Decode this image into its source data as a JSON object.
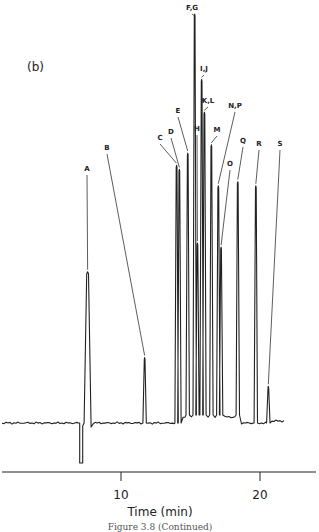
{
  "figure": {
    "panel_label": "(b)",
    "caption": "Figure 3.8 (Continued)"
  },
  "axis": {
    "xlabel": "Time (min)",
    "ticks": [
      {
        "value": 10,
        "label": "10"
      },
      {
        "value": 20,
        "label": "20"
      }
    ]
  },
  "chart_data": {
    "type": "line",
    "title": "(b)",
    "xlabel": "Time (min)",
    "ylabel": "",
    "xlim": [
      1.3,
      24.5
    ],
    "x_ticks": [
      10,
      20
    ],
    "grid": false,
    "legend": null,
    "baseline_dip": {
      "time": 7.1,
      "depth_rel": -0.17
    },
    "peaks": [
      {
        "label": "A",
        "time": 7.6,
        "height_rel": 0.37
      },
      {
        "label": "B",
        "time": 11.7,
        "height_rel": 0.16
      },
      {
        "label": "C",
        "time": 14.0,
        "height_rel": 0.63
      },
      {
        "label": "D",
        "time": 14.2,
        "height_rel": 0.62
      },
      {
        "label": "E",
        "time": 14.8,
        "height_rel": 0.66
      },
      {
        "label": "F,G",
        "time": 15.3,
        "height_rel": 1.0
      },
      {
        "label": "H",
        "time": 15.5,
        "height_rel": 0.44
      },
      {
        "label": "I,J",
        "time": 15.8,
        "height_rel": 0.84
      },
      {
        "label": "K,L",
        "time": 16.0,
        "height_rel": 0.76
      },
      {
        "label": "M",
        "time": 16.5,
        "height_rel": 0.68
      },
      {
        "label": "N,P",
        "time": 17.0,
        "height_rel": 0.58
      },
      {
        "label": "O",
        "time": 17.2,
        "height_rel": 0.43
      },
      {
        "label": "Q",
        "time": 18.4,
        "height_rel": 0.59
      },
      {
        "label": "R",
        "time": 19.7,
        "height_rel": 0.58
      },
      {
        "label": "S",
        "time": 20.6,
        "height_rel": 0.09
      }
    ]
  }
}
